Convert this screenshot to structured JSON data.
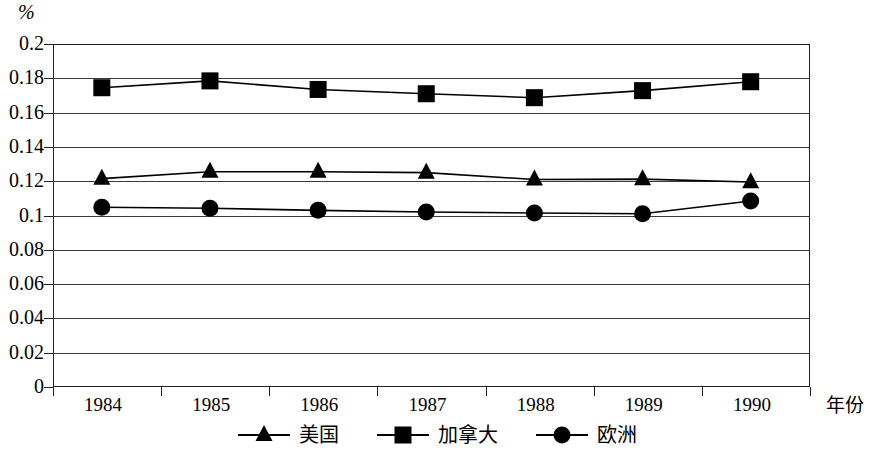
{
  "chart_data": {
    "type": "line",
    "title": "",
    "subtitle": "",
    "xlabel": "年份",
    "ylabel": "%",
    "categories": [
      "1984",
      "1985",
      "1986",
      "1987",
      "1988",
      "1989",
      "1990"
    ],
    "ylim": [
      0,
      0.2
    ],
    "y_ticks": [
      "0",
      "0.02",
      "0.04",
      "0.06",
      "0.08",
      "0.1",
      "0.12",
      "0.14",
      "0.16",
      "0.18",
      "0.2"
    ],
    "y_tick_values": [
      0,
      0.02,
      0.04,
      0.06,
      0.08,
      0.1,
      0.12,
      0.14,
      0.16,
      0.18,
      0.2
    ],
    "grid": true,
    "legend_position": "bottom",
    "series": [
      {
        "name": "美国",
        "marker": "triangle",
        "color": "#000000",
        "values": [
          0.1215,
          0.1255,
          0.1255,
          0.125,
          0.121,
          0.1212,
          0.1195
        ]
      },
      {
        "name": "加拿大",
        "marker": "square",
        "color": "#000000",
        "values": [
          0.1745,
          0.1785,
          0.1735,
          0.171,
          0.1687,
          0.1728,
          0.178
        ]
      },
      {
        "name": "欧洲",
        "marker": "circle",
        "color": "#000000",
        "values": [
          0.1048,
          0.1042,
          0.103,
          0.102,
          0.1015,
          0.101,
          0.1085
        ]
      }
    ]
  },
  "legend": {
    "items": [
      {
        "label": "美国",
        "marker": "triangle-marker"
      },
      {
        "label": "加拿大",
        "marker": "square-marker"
      },
      {
        "label": "欧洲",
        "marker": "circle-marker"
      }
    ]
  }
}
